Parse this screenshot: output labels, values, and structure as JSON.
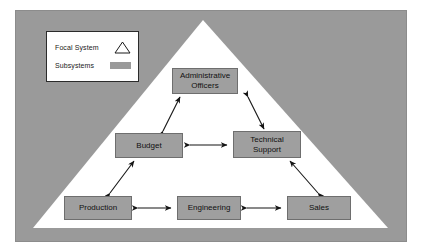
{
  "diagram": {
    "focal_system_shape": "triangle",
    "legend": {
      "items": [
        {
          "label": "Focal System",
          "symbol": "triangle-outline"
        },
        {
          "label": "Subsystems",
          "symbol": "gray-rectangle"
        }
      ]
    },
    "nodes": [
      {
        "id": "admin",
        "label": "Administrative Officers",
        "line1": "Administrative",
        "line2": "Officers",
        "tier": 1
      },
      {
        "id": "budget",
        "label": "Budget",
        "line1": "Budget",
        "line2": "",
        "tier": 2
      },
      {
        "id": "tech",
        "label": "Technical Support",
        "line1": "Technical",
        "line2": "Support",
        "tier": 2
      },
      {
        "id": "prod",
        "label": "Production",
        "line1": "Production",
        "line2": "",
        "tier": 3
      },
      {
        "id": "eng",
        "label": "Engineering",
        "line1": "Engineering",
        "line2": "",
        "tier": 3
      },
      {
        "id": "sales",
        "label": "Sales",
        "line1": "Sales",
        "line2": "",
        "tier": 3
      }
    ],
    "connections": [
      {
        "from": "budget",
        "to": "admin",
        "style": "double-arrow",
        "orientation": "diagonal"
      },
      {
        "from": "tech",
        "to": "admin",
        "style": "double-arrow",
        "orientation": "diagonal"
      },
      {
        "from": "budget",
        "to": "tech",
        "style": "double-arrow",
        "orientation": "horizontal"
      },
      {
        "from": "prod",
        "to": "budget",
        "style": "double-arrow",
        "orientation": "diagonal"
      },
      {
        "from": "sales",
        "to": "tech",
        "style": "double-arrow",
        "orientation": "diagonal"
      },
      {
        "from": "prod",
        "to": "eng",
        "style": "double-arrow",
        "orientation": "horizontal"
      },
      {
        "from": "eng",
        "to": "sales",
        "style": "double-arrow",
        "orientation": "horizontal"
      }
    ],
    "colors": {
      "field_gray": "#9a9a9a",
      "node_gray": "#9f9f9f",
      "focal_fill": "#ffffff",
      "line": "#1a1a1a"
    }
  }
}
